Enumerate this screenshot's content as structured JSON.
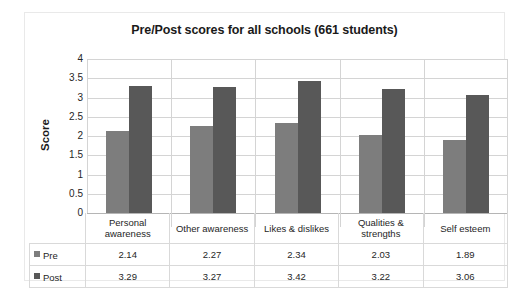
{
  "chart_data": {
    "type": "bar",
    "title": "Pre/Post scores for all schools (661 students)",
    "xlabel": "",
    "ylabel": "Score",
    "ylim": [
      0,
      4
    ],
    "yticks": [
      "4",
      "3.5",
      "3",
      "2.5",
      "2",
      "1.5",
      "1",
      "0.5",
      "0"
    ],
    "grid": true,
    "legend_position": "data-table-left",
    "categories": [
      "Personal awareness",
      "Other awareness",
      "Likes & dislikes",
      "Qualities & strengths",
      "Self esteem"
    ],
    "series": [
      {
        "name": "Pre",
        "color": "#7d7d7d",
        "values": [
          2.14,
          2.27,
          2.34,
          2.03,
          1.89
        ]
      },
      {
        "name": "Post",
        "color": "#585858",
        "values": [
          3.29,
          3.27,
          3.42,
          3.22,
          3.06
        ]
      }
    ]
  },
  "table": {
    "header_cells": [
      "Personal awareness",
      "Other awareness",
      "Likes & dislikes",
      "Qualities & strengths",
      "Self esteem"
    ],
    "rows": [
      {
        "label": "Pre",
        "values": [
          "2.14",
          "2.27",
          "2.34",
          "2.03",
          "1.89"
        ]
      },
      {
        "label": "Post",
        "values": [
          "3.29",
          "3.27",
          "3.42",
          "3.22",
          "3.06"
        ]
      }
    ]
  }
}
